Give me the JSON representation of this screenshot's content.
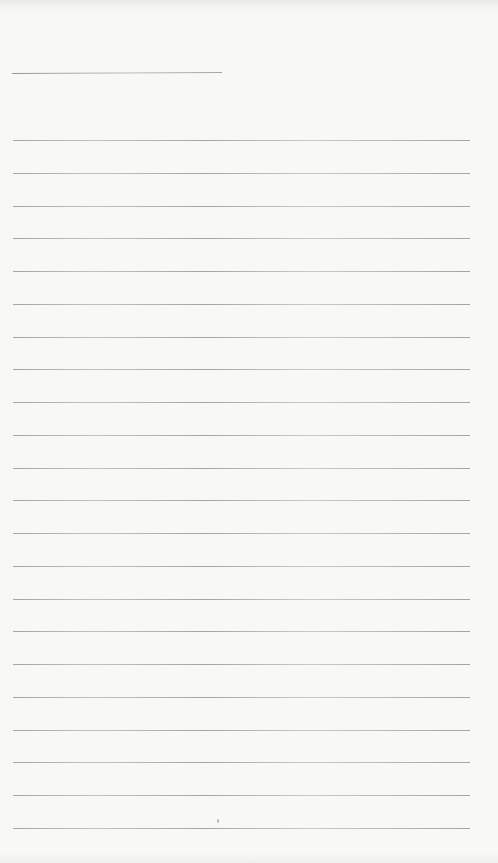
{
  "page": {
    "kind": "blank-lined-notebook-page-scan",
    "width_px": 498,
    "height_px": 863,
    "background_color": "#f8f8f6",
    "text_content": ""
  },
  "ruling": {
    "line_color": "#a0a0a0",
    "heading_line": {
      "y": 73,
      "x_start": 12,
      "x_end": 222
    },
    "body_lines": {
      "count": 22,
      "first_y": 140,
      "spacing": 32.76,
      "x_start": 13,
      "x_end": 470
    },
    "stray_mark": {
      "x": 217,
      "y": 819
    }
  }
}
